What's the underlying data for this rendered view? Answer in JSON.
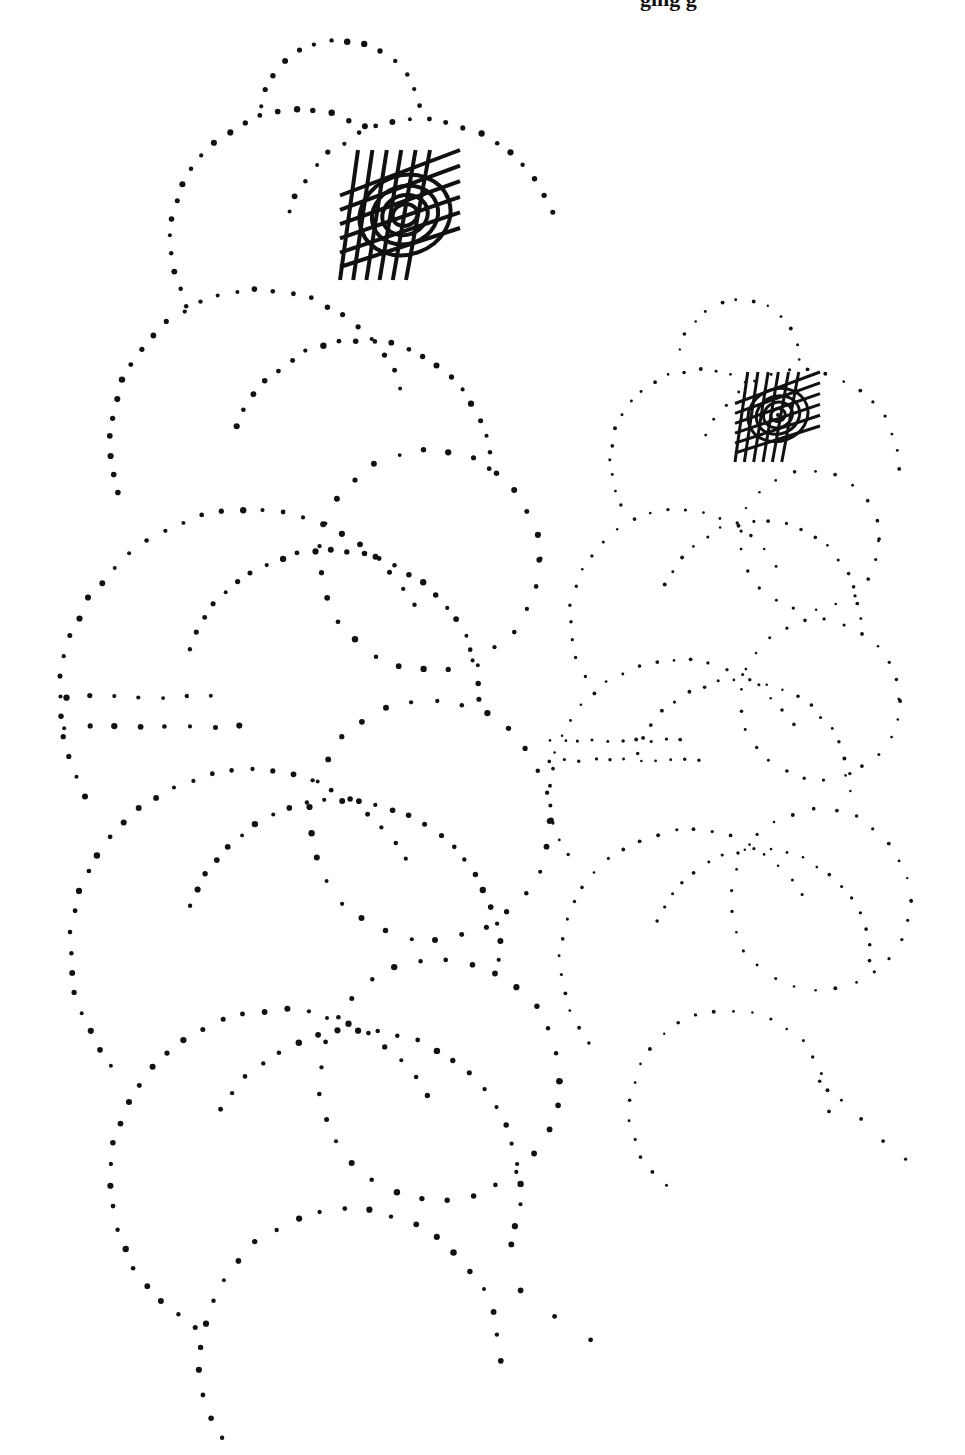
{
  "header": {
    "cut_text": "ging g"
  },
  "colors": {
    "ink": "#111111",
    "background": "#ffffff"
  },
  "figures": [
    {
      "name": "large-dotted-figure",
      "dot_radius": 2.6,
      "spiral": {
        "cx": 405,
        "cy": 215,
        "rings": [
          12,
          22,
          32,
          44
        ],
        "hatch": {
          "x": 340,
          "y": 150,
          "w": 120,
          "h": 130,
          "lines": 6
        },
        "stroke": 4
      },
      "arcs": [
        {
          "cx": 340,
          "cy": 120,
          "r": 80,
          "a0": 190,
          "a1": 350,
          "n": 14
        },
        {
          "cx": 300,
          "cy": 240,
          "r": 130,
          "a0": 150,
          "a1": 300,
          "n": 20
        },
        {
          "cx": 420,
          "cy": 260,
          "r": 140,
          "a0": 200,
          "a1": 340,
          "n": 20
        },
        {
          "cx": 260,
          "cy": 440,
          "r": 150,
          "a0": 160,
          "a1": 340,
          "n": 26
        },
        {
          "cx": 360,
          "cy": 470,
          "r": 130,
          "a0": 200,
          "a1": 360,
          "n": 22
        },
        {
          "cx": 250,
          "cy": 700,
          "r": 190,
          "a0": 150,
          "a1": 330,
          "n": 30
        },
        {
          "cx": 330,
          "cy": 700,
          "r": 150,
          "a0": 200,
          "a1": 360,
          "n": 26
        },
        {
          "cx": 250,
          "cy": 950,
          "r": 180,
          "a0": 140,
          "a1": 330,
          "n": 30
        },
        {
          "cx": 340,
          "cy": 960,
          "r": 160,
          "a0": 200,
          "a1": 360,
          "n": 26
        },
        {
          "cx": 280,
          "cy": 1180,
          "r": 170,
          "a0": 120,
          "a1": 330,
          "n": 30
        },
        {
          "cx": 360,
          "cy": 1190,
          "r": 160,
          "a0": 210,
          "a1": 380,
          "n": 24
        },
        {
          "cx": 350,
          "cy": 1360,
          "r": 150,
          "a0": 130,
          "a1": 360,
          "n": 26
        },
        {
          "cx": 430,
          "cy": 820,
          "r": 120,
          "a0": 0,
          "a1": 360,
          "n": 30
        },
        {
          "cx": 430,
          "cy": 560,
          "r": 110,
          "a0": 0,
          "a1": 360,
          "n": 28
        },
        {
          "cx": 440,
          "cy": 1080,
          "r": 120,
          "a0": 0,
          "a1": 360,
          "n": 30
        },
        {
          "cx": 150,
          "cy": 690,
          "r": 80,
          "a0": 0,
          "a1": 0,
          "n": 0
        }
      ],
      "lines": [
        {
          "x0": 65,
          "y0": 697,
          "x1": 210,
          "y1": 697,
          "n": 7
        },
        {
          "x0": 65,
          "y0": 727,
          "x1": 240,
          "y1": 727,
          "n": 8
        },
        {
          "x0": 520,
          "y0": 1290,
          "x1": 590,
          "y1": 1340,
          "n": 3
        }
      ]
    },
    {
      "name": "small-dotted-figure",
      "dot_radius": 1.6,
      "spiral": {
        "cx": 778,
        "cy": 415,
        "rings": [
          7,
          14,
          21,
          29
        ],
        "hatch": {
          "x": 735,
          "y": 372,
          "w": 85,
          "h": 90,
          "lines": 6
        },
        "stroke": 3
      },
      "arcs": [
        {
          "cx": 740,
          "cy": 360,
          "r": 60,
          "a0": 190,
          "a1": 360,
          "n": 12
        },
        {
          "cx": 700,
          "cy": 460,
          "r": 90,
          "a0": 150,
          "a1": 300,
          "n": 16
        },
        {
          "cx": 800,
          "cy": 470,
          "r": 100,
          "a0": 200,
          "a1": 360,
          "n": 16
        },
        {
          "cx": 680,
          "cy": 620,
          "r": 110,
          "a0": 150,
          "a1": 330,
          "n": 20
        },
        {
          "cx": 760,
          "cy": 620,
          "r": 100,
          "a0": 200,
          "a1": 360,
          "n": 18
        },
        {
          "cx": 680,
          "cy": 790,
          "r": 130,
          "a0": 150,
          "a1": 330,
          "n": 24
        },
        {
          "cx": 740,
          "cy": 790,
          "r": 110,
          "a0": 200,
          "a1": 360,
          "n": 20
        },
        {
          "cx": 690,
          "cy": 960,
          "r": 130,
          "a0": 140,
          "a1": 330,
          "n": 24
        },
        {
          "cx": 760,
          "cy": 960,
          "r": 110,
          "a0": 200,
          "a1": 360,
          "n": 20
        },
        {
          "cx": 730,
          "cy": 1110,
          "r": 100,
          "a0": 130,
          "a1": 360,
          "n": 22
        },
        {
          "cx": 820,
          "cy": 700,
          "r": 80,
          "a0": 0,
          "a1": 360,
          "n": 26
        },
        {
          "cx": 820,
          "cy": 900,
          "r": 90,
          "a0": 0,
          "a1": 360,
          "n": 28
        },
        {
          "cx": 810,
          "cy": 540,
          "r": 70,
          "a0": 0,
          "a1": 360,
          "n": 22
        }
      ],
      "lines": [
        {
          "x0": 550,
          "y0": 740,
          "x1": 680,
          "y1": 740,
          "n": 10
        },
        {
          "x0": 550,
          "y0": 760,
          "x1": 700,
          "y1": 760,
          "n": 11
        },
        {
          "x0": 820,
          "y0": 1080,
          "x1": 905,
          "y1": 1160,
          "n": 5
        }
      ]
    }
  ]
}
